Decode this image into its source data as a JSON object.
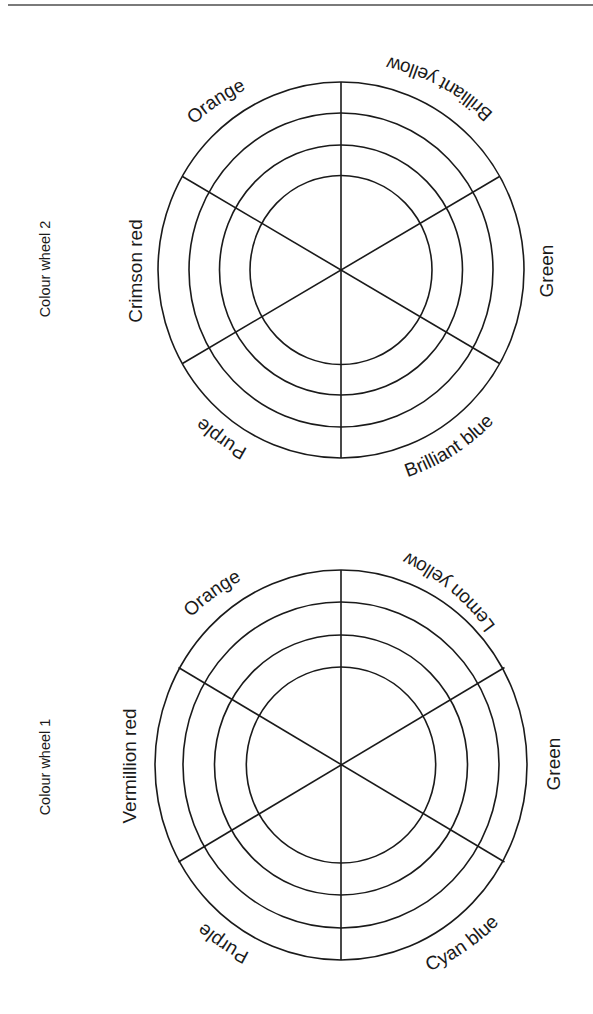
{
  "page": {
    "header_rule_color": "#7a7a7a"
  },
  "wheels": [
    {
      "caption": "Colour wheel 2",
      "labels": {
        "top_left": "Orange",
        "top_right": "Brilliant yellow",
        "right": "Green",
        "bottom_right": "Brilliant blue",
        "bottom_left": "Purple",
        "left": "Crimson red"
      },
      "rings": 4,
      "segments": 6
    },
    {
      "caption": "Colour wheel 1",
      "labels": {
        "top_left": "Orange",
        "top_right": "Lemon yellow",
        "right": "Green",
        "bottom_right": "Cyan blue",
        "bottom_left": "Purple",
        "left": "Vermillion red"
      },
      "rings": 4,
      "segments": 6
    }
  ]
}
